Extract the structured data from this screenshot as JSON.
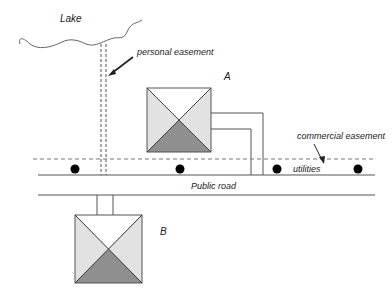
{
  "diagram": {
    "labels": {
      "lake": "Lake",
      "personal_easement": "personal easement",
      "house_a": "A",
      "house_b": "B",
      "commercial_easement": "commercial easement",
      "utilities": "utilities",
      "public_road": "Public road"
    },
    "colors": {
      "line": "#555555",
      "roof_light": "#e2e2e2",
      "roof_white": "#ffffff",
      "roof_dark": "#8f8f8f",
      "dot": "#000000"
    }
  }
}
